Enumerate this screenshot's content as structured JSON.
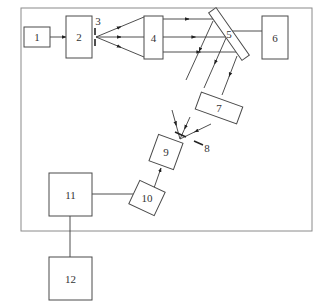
{
  "diagram": {
    "title": "",
    "frame": {
      "x": 21,
      "y": 8,
      "w": 291,
      "h": 223,
      "color": "#8a8a8a"
    },
    "blocks": [
      {
        "id": "1",
        "label": "1",
        "x": 24,
        "y": 27,
        "w": 26,
        "h": 20,
        "rotate": 0
      },
      {
        "id": "2",
        "label": "2",
        "x": 66,
        "y": 16,
        "w": 26,
        "h": 42,
        "rotate": 0
      },
      {
        "id": "4",
        "label": "4",
        "x": 144,
        "y": 16,
        "w": 19,
        "h": 43,
        "rotate": 0
      },
      {
        "id": "5",
        "label": "5",
        "cx": 229,
        "cy": 34,
        "w": 9,
        "h": 58,
        "rotate": -35
      },
      {
        "id": "6",
        "label": "6",
        "x": 262,
        "y": 16,
        "w": 26,
        "h": 43,
        "rotate": 0
      },
      {
        "id": "7",
        "label": "7",
        "cx": 219,
        "cy": 108,
        "w": 44,
        "h": 18,
        "rotate": 20
      },
      {
        "id": "9",
        "label": "9",
        "cx": 166,
        "cy": 152,
        "w": 26,
        "h": 28,
        "rotate": 20
      },
      {
        "id": "10",
        "label": "10",
        "cx": 147,
        "cy": 198,
        "w": 28,
        "h": 26,
        "rotate": 25
      },
      {
        "id": "11",
        "label": "11",
        "x": 49,
        "y": 173,
        "w": 43,
        "h": 43,
        "rotate": 0
      },
      {
        "id": "12",
        "label": "12",
        "x": 49,
        "y": 257,
        "w": 43,
        "h": 43,
        "rotate": 0
      }
    ],
    "annotations": [
      {
        "id": "3",
        "label": "3",
        "x": 98,
        "y": 21
      },
      {
        "id": "8",
        "label": "8",
        "x": 207,
        "y": 148
      }
    ],
    "slits": [
      {
        "id": "3",
        "segments": [
          [
            95,
            28,
            95,
            35
          ],
          [
            95,
            39,
            95,
            46
          ]
        ]
      },
      {
        "id": "8",
        "segments": [
          [
            175,
            132,
            186,
            137
          ],
          [
            194,
            141,
            203,
            145
          ]
        ]
      }
    ],
    "connectors": [
      {
        "from": "1",
        "to": "2",
        "points": [
          [
            50,
            37
          ],
          [
            66,
            37
          ]
        ],
        "arrow": "end"
      },
      {
        "from": "4",
        "to": "3",
        "points": [
          [
            144,
            17
          ],
          [
            96,
            37
          ]
        ],
        "arrow": "mid-reverse"
      },
      {
        "from": "4",
        "to": "3",
        "points": [
          [
            144,
            37
          ],
          [
            96,
            37
          ]
        ],
        "arrow": "mid-reverse"
      },
      {
        "from": "4",
        "to": "3",
        "points": [
          [
            144,
            57
          ],
          [
            96,
            37
          ]
        ],
        "arrow": "mid-reverse"
      },
      {
        "from": "4",
        "to": "5",
        "points": [
          [
            163,
            19
          ],
          [
            213,
            19
          ]
        ],
        "arrow": "mid"
      },
      {
        "from": "4",
        "to": "5",
        "points": [
          [
            163,
            37
          ],
          [
            226,
            37
          ]
        ],
        "arrow": "mid"
      },
      {
        "from": "4",
        "to": "5",
        "points": [
          [
            163,
            52
          ],
          [
            236,
            52
          ]
        ],
        "arrow": "mid"
      },
      {
        "from": "5",
        "to": "6",
        "points": [
          [
            232,
            31
          ],
          [
            262,
            31
          ]
        ],
        "arrow": "none"
      },
      {
        "from": "5",
        "to": "7",
        "points": [
          [
            213,
            21
          ],
          [
            186,
            80
          ]
        ],
        "arrow": "mid"
      },
      {
        "from": "5",
        "to": "7",
        "points": [
          [
            226,
            38
          ],
          [
            204,
            88
          ]
        ],
        "arrow": "mid"
      },
      {
        "from": "5",
        "to": "7",
        "points": [
          [
            237,
            56
          ],
          [
            222,
            95
          ]
        ],
        "arrow": "mid"
      },
      {
        "from": "7",
        "to": "8",
        "points": [
          [
            172,
            110
          ],
          [
            180,
            139
          ]
        ],
        "arrow": "mid"
      },
      {
        "from": "7",
        "to": "8",
        "points": [
          [
            190,
            117
          ],
          [
            180,
            139
          ]
        ],
        "arrow": "mid"
      },
      {
        "from": "7",
        "to": "8",
        "points": [
          [
            211,
            124
          ],
          [
            180,
            139
          ]
        ],
        "arrow": "mid"
      },
      {
        "from": "10",
        "to": "9",
        "points": [
          [
            154,
            188
          ],
          [
            161,
            168
          ]
        ],
        "arrow": "end"
      },
      {
        "from": "11",
        "to": "10",
        "points": [
          [
            92,
            194
          ],
          [
            133,
            194
          ]
        ],
        "arrow": "none"
      },
      {
        "from": "11",
        "to": "12",
        "points": [
          [
            70,
            216
          ],
          [
            70,
            257
          ]
        ],
        "arrow": "none"
      }
    ]
  }
}
